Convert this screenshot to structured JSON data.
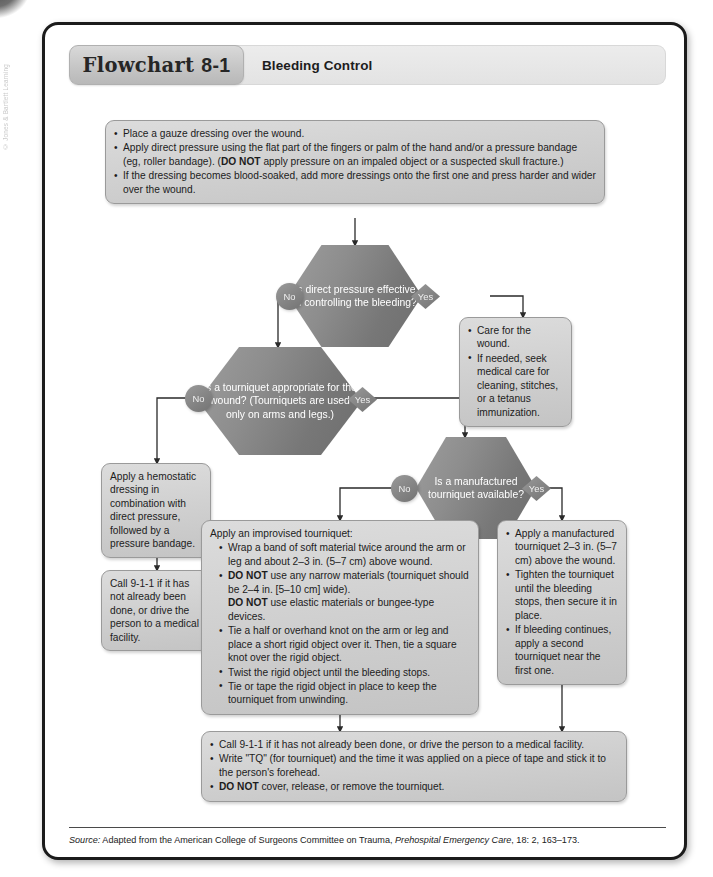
{
  "watermark": "© Jones & Bartlett Learning",
  "header": {
    "tab_label": "Flowchart",
    "tab_number": "8-1",
    "title": "Bleeding Control"
  },
  "nodes": {
    "start": {
      "items": [
        "Place a gauze dressing over the wound.",
        "Apply direct pressure using the flat part of the fingers or palm of the hand and/or a pressure bandage (eg, roller bandage). (DO NOT apply pressure on an impaled object or a suspected skull fracture.)",
        "If the dressing becomes blood-soaked, add more dressings onto the first one and press harder and wider over the wound."
      ]
    },
    "decision1": {
      "text": "Is direct pressure effective in controlling the bleeding?"
    },
    "decision2": {
      "text": "Is a tourniquet appropriate for the wound? (Tourniquets are used only on arms and legs.)"
    },
    "decision3": {
      "text": "Is a manufactured tourniquet available?"
    },
    "care_wound": {
      "items": [
        "Care for the wound.",
        "If needed, seek medical care for cleaning, stitches, or a tetanus immunization."
      ]
    },
    "hemostatic": {
      "text": "Apply a hemostatic dressing in combination with direct pressure, followed by a pressure bandage."
    },
    "call911_left": {
      "text": "Call 9-1-1 if it has not already been done, or drive the person to a medical facility."
    },
    "improvised": {
      "lead": "Apply an improvised tourniquet:",
      "items": [
        "Wrap a band of soft material twice around the arm or leg and about 2–3 in. (5–7 cm) above wound.",
        "DO NOT use any narrow materials (tourniquet should be 2–4 in. [5–10 cm] wide). DO NOT use elastic materials or bungee-type devices.",
        "Tie a half or overhand knot on the arm or leg and place a short rigid object over it. Then, tie a square knot over the rigid object.",
        "Twist the rigid object until the bleeding stops.",
        "Tie or tape the rigid object in place to keep the tourniquet from unwinding."
      ]
    },
    "manufactured": {
      "items": [
        "Apply a manufactured tourniquet 2–3 in. (5–7 cm) above the wound.",
        "Tighten the tourniquet until the bleeding stops, then secure it in place.",
        "If bleeding continues, apply a second tourniquet near the first one."
      ]
    },
    "final": {
      "items": [
        "Call 9-1-1 if it has not already been done, or drive the person to a medical facility.",
        "Write \"TQ\" (for tourniquet) and the time it was applied on a piece of tape and stick it to the person's forehead.",
        "DO NOT cover, release, or remove the tourniquet."
      ]
    }
  },
  "badges": {
    "no1": "No",
    "yes1": "Yes",
    "no2": "No",
    "yes2": "Yes",
    "no3": "No",
    "yes3": "Yes"
  },
  "source": {
    "label": "Source:",
    "text_before": " Adapted from the American College of Surgeons Committee on Trauma, ",
    "italic": "Prehospital Emergency Care",
    "text_after": ", 18: 2, 163–173."
  },
  "colors": {
    "frame_border": "#1b1b1b",
    "box_fill": "#d4d4d4",
    "hex_fill": "#808080",
    "badge_fill": "#8a8a8a",
    "text": "#1c1c1c",
    "hex_text": "#ffffff"
  }
}
